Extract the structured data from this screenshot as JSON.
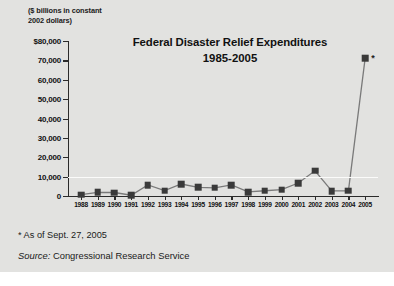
{
  "axis_note": "($ billions in constant\n2002 dollars)",
  "footnote": "* As of Sept. 27, 2005",
  "source": {
    "label": "Source:",
    "value": " Congressional Research Service"
  },
  "spike_marker_note": "*",
  "colors": {
    "background": "#e2e2e0",
    "marker": "#3a3a3a",
    "line": "#7a7a7a",
    "axis": "#2b2b2b",
    "gridline": "#fbfbfa",
    "text": "#111111"
  },
  "chart_data": {
    "type": "line",
    "title": "Federal Disaster Relief Expenditures",
    "subtitle": "1985-2005",
    "xlabel": "",
    "ylabel": "($ billions in constant 2002 dollars)",
    "ylim": [
      0,
      80000
    ],
    "ytick_values": [
      0,
      10000,
      20000,
      30000,
      40000,
      50000,
      60000,
      70000,
      80000
    ],
    "ytick_labels": [
      "0",
      "10,000",
      "20,000",
      "30,000",
      "40,000",
      "50,000",
      "60,000",
      "70,000",
      "$80,000"
    ],
    "grid": false,
    "gridline_at": 10000,
    "legend": "none",
    "marker_style": "filled-square",
    "categories": [
      "1988",
      "1989",
      "1990",
      "1991",
      "1992",
      "1993",
      "1994",
      "1995",
      "1996",
      "1997",
      "1998",
      "1999",
      "2000",
      "2001",
      "2002",
      "2003",
      "2004",
      "2005"
    ],
    "values": [
      700,
      1900,
      1800,
      400,
      5700,
      2800,
      6200,
      4500,
      4200,
      5700,
      2100,
      2700,
      3300,
      6700,
      13000,
      2600,
      2700,
      71000
    ],
    "annotations": [
      {
        "category": "2005",
        "text": "*",
        "note": "As of Sept. 27, 2005"
      }
    ]
  }
}
